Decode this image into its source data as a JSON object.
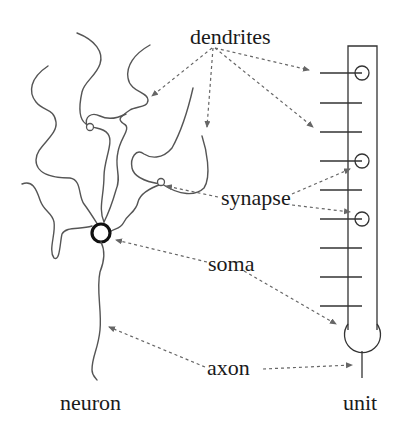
{
  "diagram": {
    "labels": {
      "dendrites": "dendrites",
      "synapse": "synapse",
      "soma": "soma",
      "axon": "axon",
      "neuron": "neuron",
      "unit": "unit"
    },
    "parts": [
      {
        "name": "dendrites",
        "points_to": [
          "neuron dendrite tips",
          "unit input lines"
        ]
      },
      {
        "name": "synapse",
        "points_to": [
          "neuron synapse knob",
          "unit input circles"
        ]
      },
      {
        "name": "soma",
        "points_to": [
          "neuron cell body",
          "unit bulb"
        ]
      },
      {
        "name": "axon",
        "points_to": [
          "neuron axon",
          "unit output line"
        ]
      }
    ],
    "unit": {
      "input_count": 9,
      "synapse_circle_inputs": [
        1,
        4,
        6
      ]
    },
    "colors": {
      "ink": "#1a1a1a",
      "curve": "#555555",
      "dashed_arrow": "#666666",
      "background": "#ffffff"
    }
  }
}
